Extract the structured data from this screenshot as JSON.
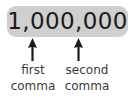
{
  "figure": {
    "number": {
      "value": "1,000,000",
      "pill_color": "#cfcfcf",
      "text_color": "#1b1b1b"
    },
    "annotations": [
      {
        "arrow_icon": "up-arrow-icon",
        "line1": "first",
        "line2": "comma"
      },
      {
        "arrow_icon": "up-arrow-icon",
        "line1": "second",
        "line2": "comma"
      }
    ],
    "background_color": "#ffffff",
    "caption_color": "#3a3a3a"
  }
}
